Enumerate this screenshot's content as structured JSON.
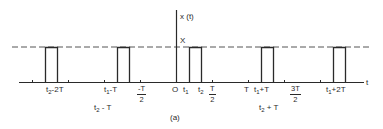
{
  "figure": {
    "caption": "(a)",
    "y_axis_label": "x (t)",
    "x_axis_label": "t",
    "amplitude_label": "X"
  },
  "signal": {
    "type": "periodic rectangular pulse train",
    "amplitude": "X",
    "period": "T",
    "pulse_start": "t1",
    "pulse_end": "t2"
  },
  "tick_labels": {
    "t2_minus_2T": {
      "base": "t",
      "sub": "2",
      "rest": "-2T"
    },
    "t1_minus_T": {
      "base": "t",
      "sub": "1",
      "rest": "-T"
    },
    "t2_minus_T": {
      "base": "t",
      "sub": "2",
      "rest": " - T"
    },
    "neg_T_over_2": {
      "num": "-T",
      "den": "2"
    },
    "origin": "O",
    "t1": {
      "base": "t",
      "sub": "1"
    },
    "t2": {
      "base": "t",
      "sub": "2"
    },
    "T_over_2": {
      "num": "T",
      "den": "2"
    },
    "T": "T",
    "t1_plus_T": {
      "base": "t",
      "sub": "1",
      "rest": "+T"
    },
    "t2_plus_T": {
      "base": "t",
      "sub": "2",
      "rest": " + T"
    },
    "three_T_over_2": {
      "num": "3T",
      "den": "2"
    },
    "t1_plus_2T": {
      "base": "t",
      "sub": "1",
      "rest": "+2T"
    }
  },
  "colors": {
    "line": "#2a2a2a",
    "dashed": "#555555",
    "background": "#ffffff"
  }
}
